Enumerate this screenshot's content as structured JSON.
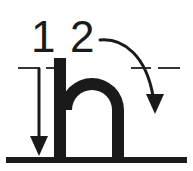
{
  "diagram": {
    "type": "handwriting-stroke-order",
    "letter": "n",
    "letter_case": "lowercase",
    "background_color": "#ffffff",
    "ink_color": "#1a1a1a",
    "guide_color": "#333333",
    "strokes": [
      {
        "number": "1",
        "name": "downstroke",
        "label": "1",
        "direction": "top-to-bottom",
        "arrow": "straight-down-arrow",
        "start": {
          "x": 39,
          "y": 68
        },
        "end": {
          "x": 39,
          "y": 155
        }
      },
      {
        "number": "2",
        "name": "arch-stroke",
        "label": "2",
        "direction": "up-over-and-down",
        "arrow": "curved-down-arrow",
        "start": {
          "x": 100,
          "y": 40
        },
        "end": {
          "x": 155,
          "y": 113
        }
      }
    ],
    "guides": {
      "midline_name": "dashed-midline",
      "midline_y": 68,
      "midline_style": "dashed",
      "baseline_name": "solid-baseline",
      "baseline_y": 160,
      "baseline_style": "solid"
    },
    "letterform": {
      "name": "letter-n-glyph",
      "stem_left_x": 54,
      "stem_right_x": 118,
      "arch_top_y": 58,
      "baseline_y": 158,
      "stroke_width": 12
    }
  }
}
